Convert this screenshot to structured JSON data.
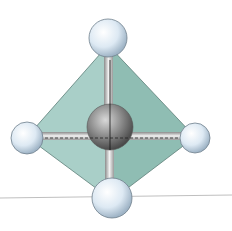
{
  "figure": {
    "central_atom": {
      "color": "#8a8a8a"
    },
    "outer_atoms": {
      "count": 4,
      "color": "#d6e6f2"
    },
    "tetrahedron_face_colors": [
      "#a9cfc8",
      "#8fbdb3"
    ],
    "baseline_color": "#bfbfbf"
  }
}
